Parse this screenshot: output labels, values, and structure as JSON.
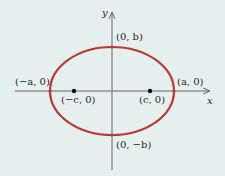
{
  "diagram": {
    "type": "ellipse-with-foci",
    "colors": {
      "background": "#e5efed",
      "ellipse": "#b83a33",
      "axis": "#5a5a5a",
      "point": "#111111",
      "text": "#2a2a2a"
    },
    "axes": {
      "x_label": "x",
      "y_label": "y"
    },
    "labels": {
      "neg_a": "(−a, 0)",
      "pos_a": "(a, 0)",
      "pos_b": "(0, b)",
      "neg_b": "(0, −b)",
      "neg_c": "(−c, 0)",
      "pos_c": "(c, 0)"
    },
    "geometry": {
      "center": [
        112,
        91
      ],
      "rx": 62,
      "ry": 44,
      "foci_x": [
        74,
        150
      ]
    }
  }
}
